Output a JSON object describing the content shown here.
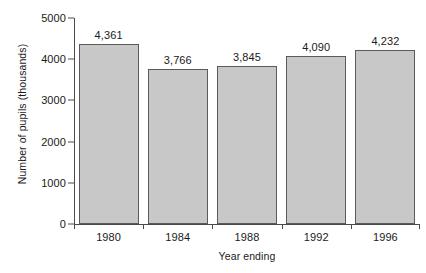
{
  "chart_data": {
    "type": "bar",
    "title": "",
    "subtitle": "",
    "xlabel": "Year ending",
    "ylabel": "Number of pupils (thousands)",
    "categories": [
      "1980",
      "1984",
      "1988",
      "1992",
      "1996"
    ],
    "values": [
      4361,
      3766,
      3845,
      4090,
      4232
    ],
    "data_labels": [
      "4,361",
      "3,766",
      "3,845",
      "4,090",
      "4,232"
    ],
    "series": [
      {
        "name": "Number of pupils",
        "values": [
          4361,
          3766,
          3845,
          4090,
          4232
        ]
      }
    ],
    "ylim": [
      0,
      5000
    ],
    "y_ticks": [
      0,
      1000,
      2000,
      3000,
      4000,
      5000
    ],
    "y_tick_labels": [
      "0",
      "1000",
      "2000",
      "3000",
      "4000",
      "5000"
    ],
    "grid": false,
    "legend": false,
    "legend_position": "none",
    "bar_fill_color": "#c8c8c8",
    "bar_border_color": "#5a5a5a",
    "axis_color": "#4a4a4a",
    "text_color": "#1a1a1a",
    "background_color": "#ffffff"
  },
  "axes": {
    "y_title": "Number of pupils (thousands)",
    "x_title": "Year ending"
  }
}
